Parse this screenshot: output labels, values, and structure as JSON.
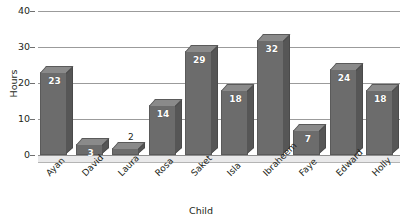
{
  "chart_data": {
    "type": "bar",
    "title": "",
    "xlabel": "Child",
    "ylabel": "Hours",
    "categories": [
      "Ayan",
      "David",
      "Laura",
      "Rosa",
      "Saket",
      "Isla",
      "Ibraheem",
      "Faye",
      "Edward",
      "Holly"
    ],
    "values": [
      23,
      3,
      2,
      14,
      29,
      18,
      32,
      7,
      24,
      18
    ],
    "value_label_position": [
      "inside",
      "inside",
      "above",
      "inside",
      "inside",
      "inside",
      "inside",
      "inside",
      "inside",
      "inside"
    ],
    "ylim": [
      0,
      40
    ],
    "yticks": [
      0,
      10,
      20,
      30,
      40
    ],
    "ytick_labels": [
      "0",
      "10",
      "20",
      "30",
      "40"
    ],
    "grid": true,
    "legend": false,
    "style_3d": true,
    "bar_color": "#6c6c6c",
    "bar_top_color": "#8a8a8a",
    "bar_side_color": "#565656",
    "gridline_color": "#9b9b9b",
    "value_label_color": "#ffffff",
    "background": "#ffffff"
  }
}
